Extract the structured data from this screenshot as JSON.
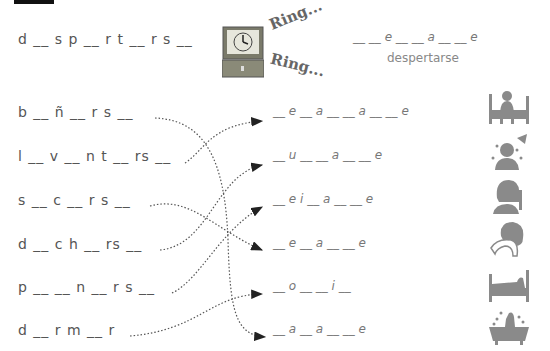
{
  "example": {
    "left_word": "d __ s p __ r t __ r s __",
    "right_pattern": "__ __ e __ __ a __ __ e",
    "answer_hint": "despertarse",
    "ring_1": "Ring...",
    "ring_2": "Ring..."
  },
  "left_words": [
    {
      "text": "b __ ñ __ r s __"
    },
    {
      "text": "l __ v __ n t __ rs __"
    },
    {
      "text": "s __ c __ r s __"
    },
    {
      "text": "d __ c h __ rs __"
    },
    {
      "text": "p __ __ n __ r s __"
    },
    {
      "text": "d __ r m __ r"
    }
  ],
  "right_patterns": [
    {
      "text": "__ e __ a __ __ a __ __ e",
      "picture": "waking-in-bed-icon"
    },
    {
      "text": "__ u __ __ a __ __ e",
      "picture": "shower-icon"
    },
    {
      "text": "__ e i __ a __ __ e",
      "picture": "combing-hair-icon"
    },
    {
      "text": "__ e __ a __ __ e",
      "picture": "towel-drying-icon"
    },
    {
      "text": "__ o __ __ i __",
      "picture": "sleeping-in-bed-icon"
    },
    {
      "text": "__ a __ a __ __ e",
      "picture": "bathtub-icon"
    }
  ],
  "connections": [
    [
      0,
      5
    ],
    [
      1,
      0
    ],
    [
      2,
      3
    ],
    [
      3,
      1
    ],
    [
      4,
      2
    ],
    [
      5,
      4
    ]
  ],
  "colors": {
    "ink": "#555555",
    "icon": "#8a8a8a",
    "line": "#555555"
  }
}
